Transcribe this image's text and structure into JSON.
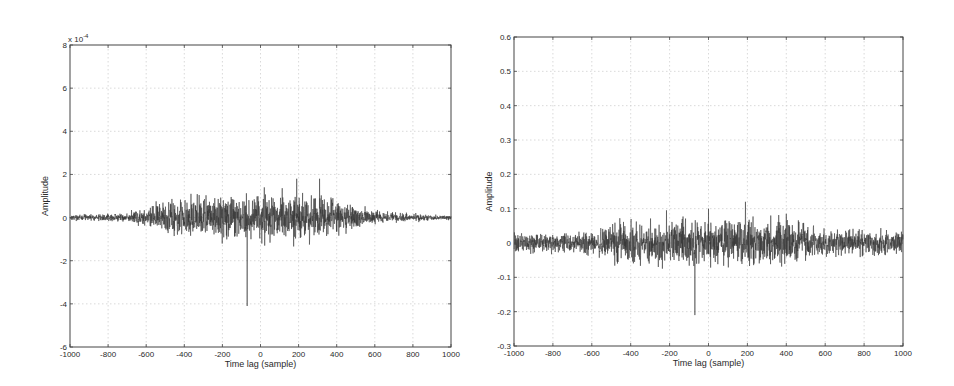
{
  "chart_data": [
    {
      "type": "line",
      "title": "",
      "xlabel": "Time lag (sample)",
      "ylabel": "Amplitude",
      "xlim": [
        -1000,
        1000
      ],
      "ylim": [
        -6,
        8
      ],
      "y_scale_label": "x 10^-4",
      "x_ticks": [
        -1000,
        -800,
        -600,
        -400,
        -200,
        0,
        200,
        400,
        600,
        800,
        1000
      ],
      "x_tick_labels": [
        "-1000",
        "-800",
        "-600",
        "-400",
        "-200",
        "0",
        "200",
        "400",
        "600",
        "800",
        "1000"
      ],
      "y_ticks": [
        -6,
        -4,
        -2,
        0,
        2,
        4,
        6,
        8
      ],
      "y_tick_labels": [
        "-6",
        "-4",
        "-2",
        "0",
        "2",
        "4",
        "6",
        "8"
      ],
      "grid": true,
      "legend": null,
      "series": [
        {
          "name": "cross-correlation",
          "color": "#333333",
          "noise_envelope": [
            {
              "x": -1000,
              "amp": 0.08
            },
            {
              "x": -700,
              "amp": 0.12
            },
            {
              "x": -560,
              "amp": 0.35
            },
            {
              "x": -400,
              "amp": 0.6
            },
            {
              "x": -100,
              "amp": 0.65
            },
            {
              "x": 200,
              "amp": 0.7
            },
            {
              "x": 420,
              "amp": 0.55
            },
            {
              "x": 560,
              "amp": 0.2
            },
            {
              "x": 800,
              "amp": 0.12
            },
            {
              "x": 1000,
              "amp": 0.06
            }
          ],
          "spikes": [
            {
              "x": -70,
              "y": 7.8
            },
            {
              "x": -70,
              "y": -4.1
            },
            {
              "x": 20,
              "y": 1.4
            },
            {
              "x": 22,
              "y": -1.3
            },
            {
              "x": 190,
              "y": 1.8
            },
            {
              "x": 310,
              "y": 1.8
            },
            {
              "x": -365,
              "y": 1.1
            },
            {
              "x": -240,
              "y": 0.9
            },
            {
              "x": 380,
              "y": 0.9
            }
          ],
          "seed": 17
        }
      ]
    },
    {
      "type": "line",
      "title": "",
      "xlabel": "Time lag (sample)",
      "ylabel": "Amplitude",
      "xlim": [
        -1000,
        1000
      ],
      "ylim": [
        -0.3,
        0.6
      ],
      "x_ticks": [
        -1000,
        -800,
        -600,
        -400,
        -200,
        0,
        200,
        400,
        600,
        800,
        1000
      ],
      "x_tick_labels": [
        "-1000",
        "-800",
        "-600",
        "-400",
        "-200",
        "0",
        "200",
        "400",
        "600",
        "800",
        "1000"
      ],
      "y_ticks": [
        -0.3,
        -0.2,
        -0.1,
        0,
        0.1,
        0.2,
        0.3,
        0.4,
        0.5,
        0.6
      ],
      "y_tick_labels": [
        "-0.3",
        "-0.2",
        "-0.1",
        "0",
        "0.1",
        "0.2",
        "0.3",
        "0.4",
        "0.5",
        "0.6"
      ],
      "grid": true,
      "legend": null,
      "series": [
        {
          "name": "cross-correlation",
          "color": "#333333",
          "noise_envelope": [
            {
              "x": -1000,
              "amp": 0.018
            },
            {
              "x": -600,
              "amp": 0.022
            },
            {
              "x": -450,
              "amp": 0.04
            },
            {
              "x": -100,
              "amp": 0.045
            },
            {
              "x": 200,
              "amp": 0.045
            },
            {
              "x": 420,
              "amp": 0.04
            },
            {
              "x": 600,
              "amp": 0.025
            },
            {
              "x": 1000,
              "amp": 0.02
            }
          ],
          "spikes": [
            {
              "x": -70,
              "y": 0.52
            },
            {
              "x": -70,
              "y": -0.21
            },
            {
              "x": 0,
              "y": 0.1
            },
            {
              "x": 190,
              "y": 0.12
            },
            {
              "x": 320,
              "y": 0.08
            },
            {
              "x": 400,
              "y": 0.085
            },
            {
              "x": -135,
              "y": 0.07
            },
            {
              "x": -380,
              "y": -0.055
            },
            {
              "x": 330,
              "y": -0.05
            }
          ],
          "seed": 42
        }
      ]
    }
  ],
  "figures": {
    "left": {
      "xlabel": "Time lag (sample)",
      "ylabel": "Amplitude",
      "scale_prefix": "x 10",
      "scale_exp": "-4"
    },
    "right": {
      "xlabel": "Time lag (sample)",
      "ylabel": "Amplitude"
    }
  }
}
